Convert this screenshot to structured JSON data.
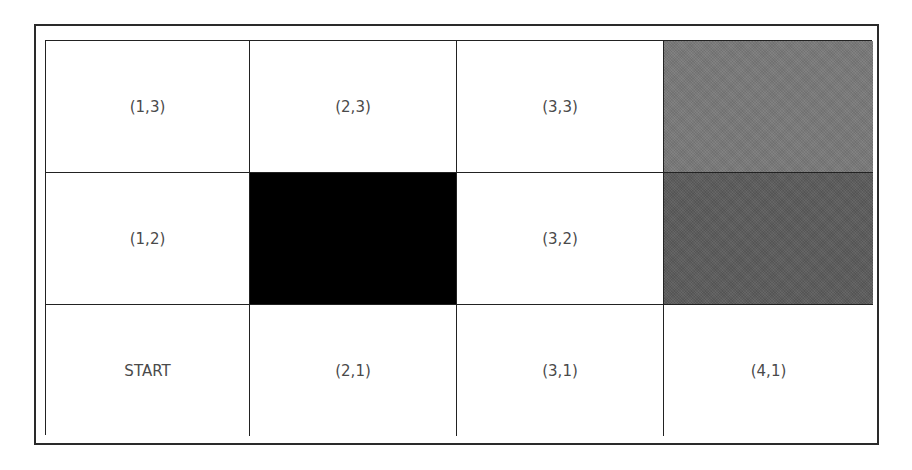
{
  "diagram": {
    "type": "gridworld",
    "columns": 4,
    "rows": 3,
    "cells": [
      {
        "label": "(1,3)",
        "col": 1,
        "row": 3,
        "fill": "white"
      },
      {
        "label": "(2,3)",
        "col": 2,
        "row": 3,
        "fill": "white"
      },
      {
        "label": "(3,3)",
        "col": 3,
        "row": 3,
        "fill": "white"
      },
      {
        "label": "",
        "col": 4,
        "row": 3,
        "fill": "goal",
        "color": "#7a7a7a"
      },
      {
        "label": "(1,2)",
        "col": 1,
        "row": 2,
        "fill": "white"
      },
      {
        "label": "",
        "col": 2,
        "row": 2,
        "fill": "black",
        "color": "#000000"
      },
      {
        "label": "(3,2)",
        "col": 3,
        "row": 2,
        "fill": "white"
      },
      {
        "label": "",
        "col": 4,
        "row": 2,
        "fill": "pit",
        "color": "#5e5e5e"
      },
      {
        "label": "START",
        "col": 1,
        "row": 1,
        "fill": "white"
      },
      {
        "label": "(2,1)",
        "col": 2,
        "row": 1,
        "fill": "white"
      },
      {
        "label": "(3,1)",
        "col": 3,
        "row": 1,
        "fill": "white"
      },
      {
        "label": "(4,1)",
        "col": 4,
        "row": 1,
        "fill": "white"
      }
    ]
  }
}
